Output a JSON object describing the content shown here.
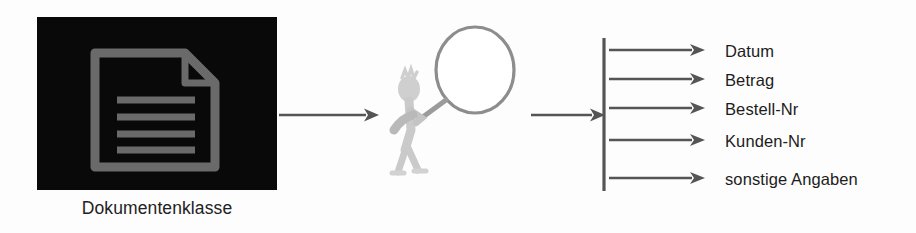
{
  "diagram": {
    "background_color": "#fdfdfd",
    "source": {
      "caption": "Dokumentenklasse",
      "thumbnail_background": "#090909",
      "icon_color": "#6a6a6a",
      "icon_name": "document-lines-icon"
    },
    "processor": {
      "figure_name": "analyst-with-magnifier",
      "magnifier_color": "#8d8d8d",
      "body_color": "#c9c9c9"
    },
    "connectors": {
      "color": "#555555",
      "arrow_doc_to_analyst": "arrow-right",
      "arrow_analyst_to_bar": "arrow-right",
      "vertical_bar_color": "#555555"
    },
    "outputs": {
      "bar_label": "extraction-bar",
      "fields": [
        {
          "label": "Datum"
        },
        {
          "label": "Betrag"
        },
        {
          "label": "Bestell-Nr"
        },
        {
          "label": "Kunden-Nr"
        },
        {
          "label": "sonstige Angaben"
        }
      ]
    }
  }
}
